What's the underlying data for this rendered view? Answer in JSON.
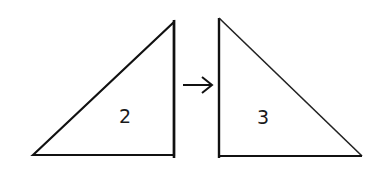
{
  "diagram": {
    "triangles": [
      {
        "label": "2",
        "points": "33,155 174,22 174,155"
      },
      {
        "label": "3",
        "points": "219,18 219,156 362,156"
      }
    ],
    "arrow": {
      "direction": "right"
    },
    "stroke_color": "#111111"
  }
}
